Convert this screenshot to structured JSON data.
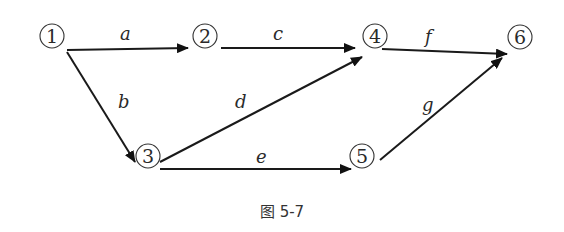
{
  "diagram": {
    "type": "directed-network",
    "nodes": [
      {
        "id": "1",
        "label": "①",
        "x": 52,
        "y": 35
      },
      {
        "id": "2",
        "label": "②",
        "x": 205,
        "y": 35
      },
      {
        "id": "3",
        "label": "③",
        "x": 147,
        "y": 155
      },
      {
        "id": "4",
        "label": "④",
        "x": 375,
        "y": 35
      },
      {
        "id": "5",
        "label": "⑤",
        "x": 360,
        "y": 155
      },
      {
        "id": "6",
        "label": "⑥",
        "x": 520,
        "y": 35
      }
    ],
    "edges": [
      {
        "from": "1",
        "to": "2",
        "label": "a"
      },
      {
        "from": "1",
        "to": "3",
        "label": "b"
      },
      {
        "from": "2",
        "to": "4",
        "label": "c"
      },
      {
        "from": "3",
        "to": "4",
        "label": "d"
      },
      {
        "from": "3",
        "to": "5",
        "label": "e"
      },
      {
        "from": "4",
        "to": "6",
        "label": "f"
      },
      {
        "from": "5",
        "to": "6",
        "label": "g"
      }
    ],
    "caption": "图 5-7"
  }
}
